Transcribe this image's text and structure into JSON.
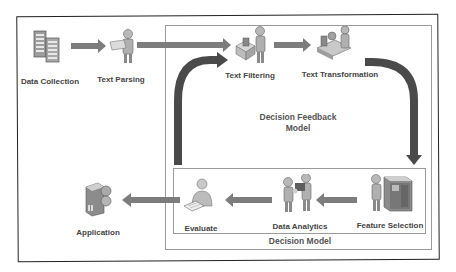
{
  "diagram": {
    "nodes": [
      {
        "id": "data_collection",
        "label": "Data Collection",
        "icon": "server-rack-icon"
      },
      {
        "id": "text_parsing",
        "label": "Text Parsing",
        "icon": "person-reading-document-icon"
      },
      {
        "id": "text_filtering",
        "label": "Text Filtering",
        "icon": "person-at-box-icon"
      },
      {
        "id": "text_transformation",
        "label": "Text Transformation",
        "icon": "machinery-operator-icon"
      },
      {
        "id": "feature_selection",
        "label": "Feature Selection",
        "icon": "person-at-cabinet-icon"
      },
      {
        "id": "data_analytics",
        "label": "Data Analytics",
        "icon": "two-people-presentation-icon"
      },
      {
        "id": "evaluate",
        "label": "Evaluate",
        "icon": "person-with-paper-icon"
      },
      {
        "id": "application",
        "label": "Application",
        "icon": "server-globe-icon"
      }
    ],
    "groups": {
      "feedback_model": {
        "label_line1": "Decision Feedback",
        "label_line2": "Model"
      },
      "decision_model": {
        "label": "Decision Model"
      }
    },
    "edges": [
      {
        "from": "data_collection",
        "to": "text_parsing"
      },
      {
        "from": "text_parsing",
        "to": "text_filtering"
      },
      {
        "from": "text_filtering",
        "to": "text_transformation"
      },
      {
        "from": "text_transformation",
        "to": "feature_selection",
        "style": "curved-thick"
      },
      {
        "from": "feature_selection",
        "to": "data_analytics"
      },
      {
        "from": "data_analytics",
        "to": "evaluate"
      },
      {
        "from": "evaluate",
        "to": "application"
      },
      {
        "from": "evaluate",
        "to": "text_filtering",
        "style": "curved-thick-feedback"
      }
    ],
    "colors": {
      "arrow_light": "#8a8a8a",
      "arrow_dark": "#4a4a4a",
      "border_outer": "#222222",
      "border_group": "#9a9a9a",
      "text": "#444444"
    }
  }
}
